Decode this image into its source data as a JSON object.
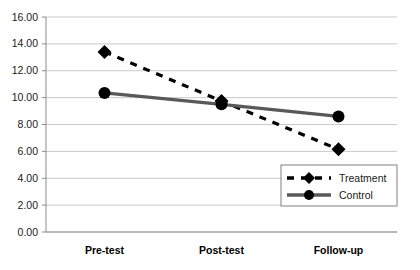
{
  "chart_data": {
    "type": "line",
    "title": "",
    "subtitle": "",
    "xlabel": "",
    "ylabel": "",
    "categories": [
      "Pre-test",
      "Post-test",
      "Follow-up"
    ],
    "series": [
      {
        "name": "Treatment",
        "values": [
          13.4,
          9.75,
          6.15
        ],
        "marker": "diamond",
        "line_style": "dashed",
        "color": "#000000"
      },
      {
        "name": "Control",
        "values": [
          10.35,
          9.5,
          8.6
        ],
        "marker": "circle",
        "line_style": "solid",
        "color": "#595959"
      }
    ],
    "ylim": [
      0,
      16
    ],
    "ytick_step": 2,
    "ytick_labels": [
      "0.00",
      "2.00",
      "4.00",
      "6.00",
      "8.00",
      "10.00",
      "12.00",
      "14.00",
      "16.00"
    ],
    "ytick_values": [
      0,
      2,
      4,
      6,
      8,
      10,
      12,
      14,
      16
    ],
    "grid": {
      "horizontal": true,
      "vertical": false,
      "color": "#c9c9c9"
    },
    "legend": {
      "position": "bottom-right-inside",
      "entries": [
        {
          "label": "Treatment",
          "marker": "diamond",
          "line_style": "dashed",
          "color": "#000000"
        },
        {
          "label": "Control",
          "marker": "circle",
          "line_style": "solid",
          "color": "#595959"
        }
      ],
      "border_color": "#808080",
      "background": "#ffffff"
    },
    "plot_area": {
      "border_color": "#a0a0a0",
      "background": "#ffffff"
    }
  }
}
